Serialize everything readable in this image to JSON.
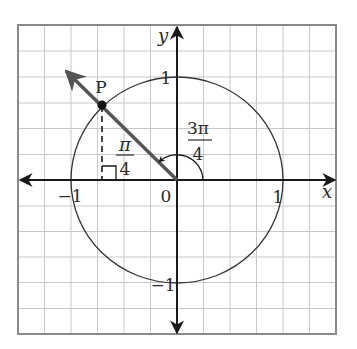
{
  "diagram": {
    "type": "unit-circle",
    "axes": {
      "x_label": "x",
      "y_label": "y"
    },
    "tick_labels": {
      "x_neg_one": "−1",
      "x_pos_one": "1",
      "y_pos_one": "1",
      "y_neg_one": "−1",
      "origin": "0"
    },
    "point": {
      "label": "P"
    },
    "reference_angle": {
      "numerator": "π",
      "denominator": "4"
    },
    "rotation_angle": {
      "numerator": "3π",
      "denominator": "4"
    },
    "colors": {
      "grid": "#c8c8c8",
      "border": "#8a8a8a",
      "axis": "#1a1a1a",
      "terminal_ray": "#555555",
      "circle": "#333333",
      "text": "#2a2a2a"
    }
  }
}
